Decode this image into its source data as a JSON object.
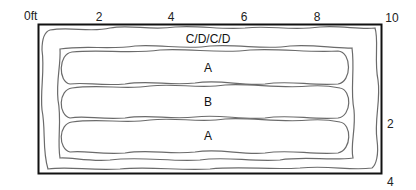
{
  "diagram": {
    "type": "plan-schematic",
    "colors": {
      "frame": "#111111",
      "outline": "#6b6b6b",
      "text": "#222222",
      "background": "#ffffff"
    },
    "x_axis": {
      "unit_label": "0ft",
      "ticks": [
        "2",
        "4",
        "6",
        "8",
        "10"
      ]
    },
    "y_axis": {
      "ticks": [
        "2",
        "4"
      ]
    },
    "zones": {
      "outer": "C/D/C/D",
      "top": "A",
      "middle": "B",
      "bottom": "A"
    }
  }
}
